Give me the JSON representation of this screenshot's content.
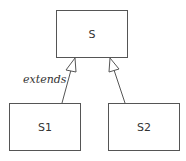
{
  "diagram": {
    "type": "uml-class-inheritance",
    "nodes": [
      {
        "id": "S",
        "label": "S"
      },
      {
        "id": "S1",
        "label": "S1"
      },
      {
        "id": "S2",
        "label": "S2"
      }
    ],
    "edges": [
      {
        "from": "S1",
        "to": "S",
        "kind": "generalization",
        "label": "extends"
      },
      {
        "from": "S2",
        "to": "S",
        "kind": "generalization",
        "label": ""
      }
    ],
    "edge_label": "extends",
    "colors": {
      "stroke": "#555555",
      "text": "#333333",
      "background": "#ffffff"
    }
  }
}
